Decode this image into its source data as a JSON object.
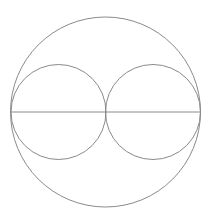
{
  "diagram": {
    "type": "geometric-figure",
    "stroke_color": "#8a8a8a",
    "background": "#ffffff",
    "outer_circle": {
      "cx": 105.5,
      "cy": 112,
      "r": 95
    },
    "inner_circles": [
      {
        "cx": 58.5,
        "cy": 112,
        "r": 47.5
      },
      {
        "cx": 153,
        "cy": 112,
        "r": 47.5
      }
    ],
    "diameter_line": {
      "x1": 10.5,
      "y1": 112,
      "x2": 200.5,
      "y2": 112
    }
  }
}
